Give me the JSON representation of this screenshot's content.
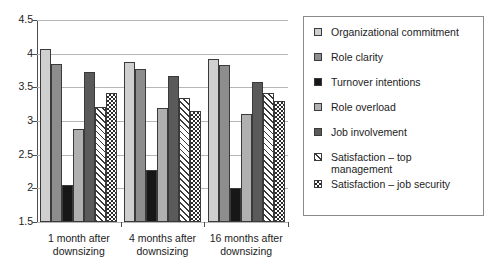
{
  "chart_data": {
    "type": "bar",
    "title": "",
    "xlabel": "",
    "ylabel": "",
    "ylim": [
      1.5,
      4.5
    ],
    "ytick_labels": [
      "4.5",
      "4",
      "3.5",
      "3",
      "2.5",
      "2",
      "1.5"
    ],
    "ytick_values": [
      4.5,
      4,
      3.5,
      3,
      2.5,
      2,
      1.5
    ],
    "grid": true,
    "legend_position": "right",
    "categories": [
      "1 month after\ndownsizing",
      "4 months after\ndownsizing",
      "16 months after\ndownsizing"
    ],
    "series": [
      {
        "name": "Organizational commitment",
        "swatch": "light-gray-solid",
        "color": "#cfcfcf",
        "values": [
          4.07,
          3.87,
          3.92
        ]
      },
      {
        "name": "Role clarity",
        "swatch": "medium-gray-solid",
        "color": "#8d8d8d",
        "values": [
          3.85,
          3.77,
          3.83
        ]
      },
      {
        "name": "Turnover intentions",
        "swatch": "black-solid",
        "color": "#171717",
        "values": [
          2.05,
          2.27,
          2.0
        ]
      },
      {
        "name": "Role overload",
        "swatch": "light-medium-gray-solid",
        "color": "#b0b0b0",
        "values": [
          2.88,
          3.19,
          3.1
        ]
      },
      {
        "name": "Job involvement",
        "swatch": "dark-gray-solid",
        "color": "#5a5a5a",
        "values": [
          3.73,
          3.67,
          3.58
        ]
      },
      {
        "name": "Satisfaction – top\nmanagement",
        "swatch": "diagonal-hatch",
        "color": "#ffffff",
        "values": [
          3.21,
          3.34,
          3.41
        ]
      },
      {
        "name": "Satisfaction – job security",
        "swatch": "checkerboard",
        "color": "#ffffff",
        "values": [
          3.42,
          3.15,
          3.29
        ]
      }
    ]
  }
}
